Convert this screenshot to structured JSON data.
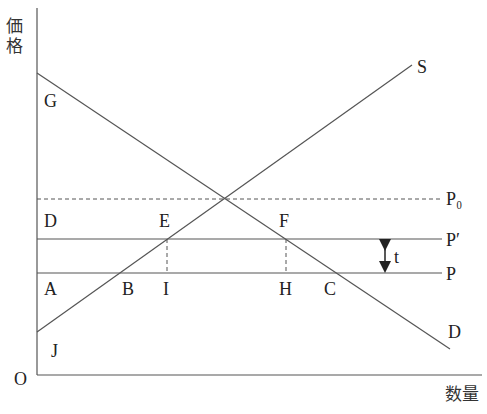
{
  "diagram": {
    "type": "supply-demand-tax",
    "axes": {
      "y_label": "価格",
      "x_label": "数量",
      "origin": "O"
    },
    "curves": {
      "supply": "S",
      "demand": "D"
    },
    "price_levels": {
      "p0": "P₀",
      "p_prime": "P′",
      "p": "P"
    },
    "tax": "t",
    "points": {
      "G": "G",
      "D": "D",
      "E": "E",
      "F": "F",
      "A": "A",
      "B": "B",
      "I": "I",
      "H": "H",
      "C": "C",
      "J": "J"
    }
  }
}
